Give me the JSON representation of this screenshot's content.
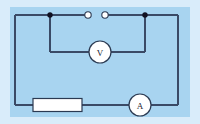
{
  "figure": {
    "kind": "electric-circuit-schematic",
    "background_outer_color": "#d9ecfa",
    "background_inner_color": "#a8d4f0",
    "wire_color": "#3a4a66",
    "component_fill": "#ffffff",
    "node_color": "#111122"
  },
  "panel": {
    "x": 10,
    "y": 7,
    "width": 180,
    "height": 110
  },
  "circuit": {
    "left_x": 15,
    "right_x": 178,
    "top_y": 15,
    "bottom_y": 105,
    "branch_y": 52
  },
  "components": {
    "voltmeter": {
      "label": "V",
      "name": "voltmeter",
      "cx": 100,
      "cy": 52,
      "r": 11
    },
    "ammeter": {
      "label": "A",
      "name": "ammeter",
      "cx": 140,
      "cy": 105,
      "r": 11
    },
    "resistor": {
      "name": "resistor",
      "x": 33,
      "y": 98,
      "width": 49,
      "height": 13,
      "label": ""
    },
    "switch_terminals": [
      {
        "name": "switch-terminal-left",
        "cx": 88,
        "cy": 15,
        "r": 3.2
      },
      {
        "name": "switch-terminal-right",
        "cx": 105,
        "cy": 15,
        "r": 3.2
      }
    ],
    "junction_nodes": [
      {
        "name": "junction-node-left",
        "cx": 50,
        "cy": 15,
        "r": 2.6
      },
      {
        "name": "junction-node-right",
        "cx": 145,
        "cy": 15,
        "r": 2.6
      }
    ]
  }
}
